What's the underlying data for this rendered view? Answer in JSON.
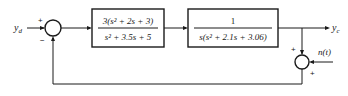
{
  "diagram": {
    "type": "feedback-block-diagram",
    "input": {
      "label": "y",
      "subscript": "d"
    },
    "output": {
      "label": "y",
      "subscript": "c"
    },
    "summing_junction_1": {
      "top_sign": "+",
      "bottom_sign": "−"
    },
    "block_1": {
      "numerator": "3(s² + 2s + 3)",
      "denominator": "s² + 3.5s + 5"
    },
    "block_2": {
      "numerator": "1",
      "denominator": "s(s² + 2.1s + 3.06)"
    },
    "summing_junction_2": {
      "top_sign": "+",
      "right_sign": "+"
    },
    "noise": {
      "label": "n(t)"
    },
    "colors": {
      "stroke": "#1a1a1a",
      "background": "#ffffff"
    }
  }
}
